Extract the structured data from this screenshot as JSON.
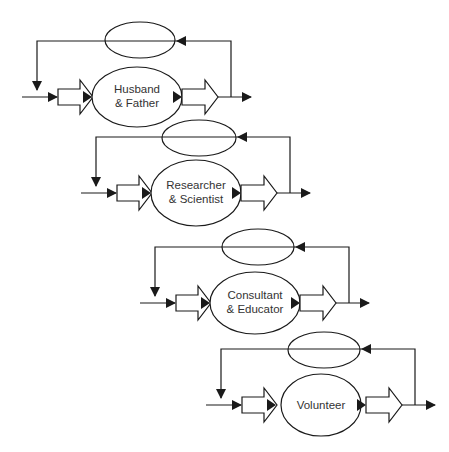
{
  "diagram": {
    "type": "feedback-loop-roles",
    "stroke_color": "#1a1a1a",
    "background": "#ffffff",
    "blocks": [
      {
        "id": "husband-father",
        "line1": "Husband",
        "line2": "& Father",
        "ox": 0,
        "oy": 0
      },
      {
        "id": "researcher-scientist",
        "line1": "Researcher",
        "line2": "& Scientist",
        "ox": 59,
        "oy": 96
      },
      {
        "id": "consultant-educator",
        "line1": "Consultant",
        "line2": "& Educator",
        "ox": 118,
        "oy": 206
      },
      {
        "id": "volunteer",
        "line1": "Volunteer",
        "line2": "",
        "ox": 184,
        "oy": 308
      }
    ]
  }
}
